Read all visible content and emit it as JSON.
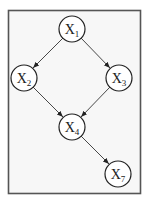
{
  "diagram": {
    "type": "directed-acyclic-graph",
    "colors": {
      "frame_border": "#555555",
      "frame_fill": "#f7f7f7",
      "node_fill": "#ffffff",
      "edge": "#333333"
    },
    "nodes": [
      {
        "id": "X1",
        "label": "X",
        "sub": "1",
        "cx": 72,
        "cy": 29
      },
      {
        "id": "X2",
        "label": "X",
        "sub": "2",
        "cx": 24,
        "cy": 78
      },
      {
        "id": "X3",
        "label": "X",
        "sub": "3",
        "cx": 119,
        "cy": 78
      },
      {
        "id": "X4",
        "label": "X",
        "sub": "4",
        "cx": 72,
        "cy": 127
      },
      {
        "id": "X7",
        "label": "X",
        "sub": "7",
        "cx": 118,
        "cy": 174
      }
    ],
    "edges": [
      {
        "from": "X1",
        "to": "X2"
      },
      {
        "from": "X1",
        "to": "X3"
      },
      {
        "from": "X2",
        "to": "X4"
      },
      {
        "from": "X3",
        "to": "X4"
      },
      {
        "from": "X4",
        "to": "X7"
      }
    ]
  }
}
